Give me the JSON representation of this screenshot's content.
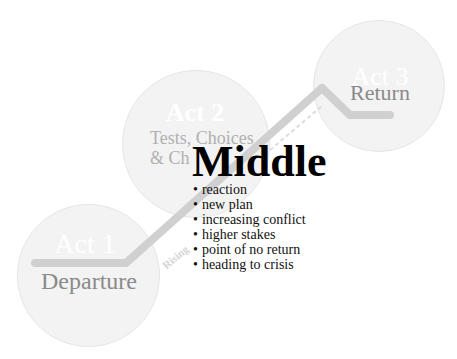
{
  "acts": [
    {
      "title": "Act 1",
      "subtitle": "Departure"
    },
    {
      "title": "Act 2",
      "subtitle_line1": "Tests, Choices",
      "subtitle_line2": "& Ch"
    },
    {
      "title": "Act 3",
      "subtitle": "Return"
    }
  ],
  "path_label": "Rising",
  "middle": {
    "title": "Middle",
    "bullets": [
      "reaction",
      "new plan",
      "increasing conflict",
      "higher stakes",
      "point of no return",
      "heading to crisis"
    ]
  },
  "colors": {
    "circle": "#f3f3f3",
    "path": "#d0d0d0",
    "subtitle": "#8a8a8a"
  }
}
